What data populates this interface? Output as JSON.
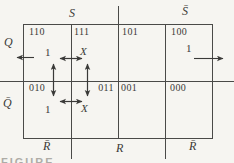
{
  "figure": {
    "kind": "karnaugh-map-excitation-diagram",
    "caption_partial": "FIGURE",
    "ink_color": "#3a3a38",
    "paper_color": "#f6f5f1"
  },
  "axis": {
    "top_left": "S",
    "top_right": "S̄",
    "left_top": "Q",
    "left_bottom": "Q̄",
    "bottom_left": "R̄",
    "bottom_center": "R",
    "bottom_right": "R̄"
  },
  "cells": [
    {
      "code": "110",
      "value": "1"
    },
    {
      "code": "111",
      "value": "X"
    },
    {
      "code": "101",
      "value": ""
    },
    {
      "code": "100",
      "value": "1"
    },
    {
      "code": "010",
      "value": "1"
    },
    {
      "code": "011",
      "value": "X"
    },
    {
      "code": "001",
      "value": ""
    },
    {
      "code": "000",
      "value": ""
    }
  ],
  "annotations": {
    "loop": "double-headed arrows linking cells 110, 111, 011, 010",
    "exit_left": "arrow out of map to the left at cell 110",
    "exit_right": "arrow out of map to the right at cell 100"
  }
}
